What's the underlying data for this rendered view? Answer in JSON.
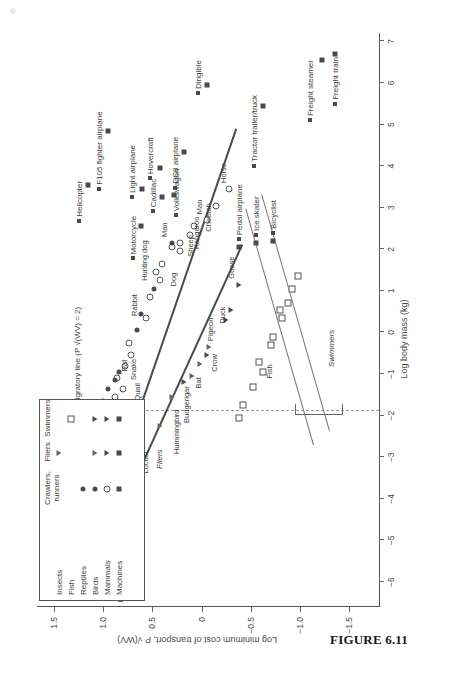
{
  "caption": "FIGURE 6.11",
  "chart_data": {
    "type": "scatter",
    "title": "",
    "xlabel": "Log body mass (kg)",
    "ylabel": "Log minimum cost of transport, P √(WV)",
    "xlim": [
      -6.6,
      7.2
    ],
    "ylim": [
      -1.8,
      1.65
    ],
    "xticks": [
      -6,
      -5,
      -4,
      -3,
      -2,
      -1,
      0,
      1,
      2,
      3,
      4,
      5,
      6,
      7
    ],
    "yticks": [
      1.5,
      1.0,
      0.5,
      0,
      -0.5,
      -1.0,
      -1.5
    ],
    "grid": false,
    "annotations": {
      "migratory_line": "Migratory line (P √(WV) = 2)",
      "group_runners": "Runners",
      "group_fliers": "Fliers",
      "group_swimmers": "Swimmers"
    },
    "legend": {
      "position": "top-left-inset",
      "columns": [
        "Crawlers,\nrunners",
        "Fliers",
        "Swimmers"
      ],
      "rows": [
        {
          "label": "Insects",
          "crawlers": "",
          "fliers": "tri-o",
          "swimmers": ""
        },
        {
          "label": "Fish",
          "crawlers": "",
          "fliers": "",
          "swimmers": "sq-o"
        },
        {
          "label": "Reptiles",
          "crawlers": "circ-f",
          "fliers": "",
          "swimmers": ""
        },
        {
          "label": "Birds",
          "crawlers": "circ-f",
          "fliers": "tri-o",
          "swimmers": "tri-f"
        },
        {
          "label": "Mammals",
          "crawlers": "circ-o",
          "fliers": "tri-f",
          "swimmers": "tri-f"
        },
        {
          "label": "Machines",
          "crawlers": "sq-f",
          "fliers": "sq-f",
          "swimmers": "sq-f"
        }
      ]
    },
    "series": [
      {
        "name": "Fliers (insects/birds/bats)",
        "marker": "tri-o",
        "points": [
          {
            "x": -6.15,
            "y": 0.95,
            "label": "Fly"
          },
          {
            "x": -6.35,
            "y": 1.22,
            "label": ""
          },
          {
            "x": -6.05,
            "y": 1.1,
            "label": ""
          },
          {
            "x": -5.75,
            "y": 1.25,
            "label": ""
          },
          {
            "x": -5.55,
            "y": 1.13,
            "label": "Mosquito"
          },
          {
            "x": -5.8,
            "y": 0.92,
            "label": ""
          },
          {
            "x": -5.55,
            "y": 0.93,
            "label": ""
          },
          {
            "x": -5.3,
            "y": 0.92,
            "label": ""
          },
          {
            "x": -5.45,
            "y": 0.82,
            "label": ""
          },
          {
            "x": -5.05,
            "y": 0.99,
            "label": "Blowfly"
          },
          {
            "x": -4.75,
            "y": 1.02,
            "label": ""
          },
          {
            "x": -4.5,
            "y": 1.05,
            "label": ""
          },
          {
            "x": -4.25,
            "y": 1.07,
            "label": "Bee"
          },
          {
            "x": -3.15,
            "y": 0.72,
            "label": "Locust"
          },
          {
            "x": -2.25,
            "y": 0.42,
            "label": "Hummingbird"
          },
          {
            "x": -1.55,
            "y": 0.3,
            "label": "Budgerigar"
          },
          {
            "x": -1.05,
            "y": 0.1,
            "label": ""
          },
          {
            "x": -0.75,
            "y": 0.02,
            "label": "Crow"
          },
          {
            "x": -0.35,
            "y": -0.08,
            "label": "Pigeon"
          }
        ]
      },
      {
        "name": "Fliers (mammal/bird filled)",
        "marker": "tri-f",
        "points": [
          {
            "x": -1.2,
            "y": 0.18,
            "label": "Bat"
          },
          {
            "x": -0.55,
            "y": -0.05,
            "label": ""
          },
          {
            "x": 0.3,
            "y": -0.25,
            "label": ""
          },
          {
            "x": 1.15,
            "y": -0.38,
            "label": "Goose"
          },
          {
            "x": 0.55,
            "y": -0.3,
            "label": "Duck"
          }
        ]
      },
      {
        "name": "Runners (mammals, open)",
        "marker": "circ-o",
        "points": [
          {
            "x": -2.6,
            "y": 1.22,
            "label": "Mice"
          },
          {
            "x": -2.4,
            "y": 1.2,
            "label": ""
          },
          {
            "x": -2.15,
            "y": 1.3,
            "label": ""
          },
          {
            "x": -2.0,
            "y": 1.38,
            "label": ""
          },
          {
            "x": -1.7,
            "y": 1.24,
            "label": ""
          },
          {
            "x": -2.1,
            "y": 1.02,
            "label": ""
          },
          {
            "x": -1.55,
            "y": 0.88,
            "label": ""
          },
          {
            "x": -1.35,
            "y": 0.8,
            "label": "Quail"
          },
          {
            "x": -1.1,
            "y": 0.86,
            "label": ""
          },
          {
            "x": -0.8,
            "y": 0.78,
            "label": ""
          },
          {
            "x": -0.55,
            "y": 0.72,
            "label": "Rat"
          },
          {
            "x": -0.25,
            "y": 0.74,
            "label": ""
          },
          {
            "x": 0.35,
            "y": 0.56,
            "label": "Rabbit"
          },
          {
            "x": 0.85,
            "y": 0.52,
            "label": ""
          },
          {
            "x": 1.25,
            "y": 0.42,
            "label": "Dog"
          },
          {
            "x": 1.45,
            "y": 0.46,
            "label": ""
          },
          {
            "x": 1.65,
            "y": 0.4,
            "label": ""
          },
          {
            "x": 1.95,
            "y": 0.22,
            "label": ""
          },
          {
            "x": 2.05,
            "y": 0.3,
            "label": ""
          },
          {
            "x": 2.35,
            "y": 0.12,
            "label": "Sheep"
          },
          {
            "x": 2.55,
            "y": 0.08,
            "label": ""
          },
          {
            "x": 2.7,
            "y": -0.05,
            "label": "Man"
          },
          {
            "x": 3.05,
            "y": -0.15,
            "label": "Cheetah"
          },
          {
            "x": 3.45,
            "y": -0.28,
            "label": "Horse"
          },
          {
            "x": 2.15,
            "y": 0.22,
            "label": "Kangaroo"
          }
        ]
      },
      {
        "name": "Reptiles / crawlers (filled circles)",
        "marker": "circ-f",
        "points": [
          {
            "x": -2.05,
            "y": 1.02,
            "label": "Lizards"
          },
          {
            "x": -1.95,
            "y": 0.95,
            "label": ""
          },
          {
            "x": -1.85,
            "y": 1.08,
            "label": ""
          },
          {
            "x": -1.75,
            "y": 0.92,
            "label": ""
          },
          {
            "x": -1.65,
            "y": 1.0,
            "label": ""
          },
          {
            "x": -1.35,
            "y": 0.95,
            "label": ""
          },
          {
            "x": -1.15,
            "y": 0.88,
            "label": ""
          },
          {
            "x": -0.95,
            "y": 0.84,
            "label": "Snake"
          },
          {
            "x": 0.05,
            "y": 0.66,
            "label": ""
          },
          {
            "x": 0.45,
            "y": 0.62,
            "label": ""
          },
          {
            "x": 1.05,
            "y": 0.48,
            "label": "Hunting dog"
          },
          {
            "x": 2.15,
            "y": 0.3,
            "label": "Man"
          }
        ]
      },
      {
        "name": "Swimmers (fish, open squares)",
        "marker": "sq-o",
        "points": [
          {
            "x": -1.3,
            "y": -0.52,
            "label": "Fish"
          },
          {
            "x": -0.95,
            "y": -0.62,
            "label": ""
          },
          {
            "x": -0.7,
            "y": -0.58,
            "label": ""
          },
          {
            "x": -0.3,
            "y": -0.7,
            "label": ""
          },
          {
            "x": -0.1,
            "y": -0.72,
            "label": ""
          },
          {
            "x": 0.35,
            "y": -0.82,
            "label": ""
          },
          {
            "x": 0.55,
            "y": -0.8,
            "label": ""
          },
          {
            "x": 0.7,
            "y": -0.88,
            "label": ""
          },
          {
            "x": 1.05,
            "y": -0.92,
            "label": ""
          },
          {
            "x": 1.35,
            "y": -0.98,
            "label": ""
          },
          {
            "x": -2.05,
            "y": -0.38,
            "label": ""
          },
          {
            "x": -1.75,
            "y": -0.42,
            "label": ""
          }
        ]
      },
      {
        "name": "Machines (filled squares)",
        "marker": "sq-f",
        "points": [
          {
            "x": 2.55,
            "y": 0.62,
            "label": "Motorcycle"
          },
          {
            "x": 3.45,
            "y": 0.6,
            "label": "Light airplane"
          },
          {
            "x": 3.25,
            "y": 0.4,
            "label": "Cadillac"
          },
          {
            "x": 3.3,
            "y": 0.28,
            "label": "Volkswagon"
          },
          {
            "x": 3.95,
            "y": 0.42,
            "label": "Hovercraft"
          },
          {
            "x": 4.85,
            "y": 0.95,
            "label": "F105 fighter airplane"
          },
          {
            "x": 4.35,
            "y": 0.18,
            "label": "DC8 airplane"
          },
          {
            "x": 5.95,
            "y": -0.05,
            "label": "Dirigible"
          },
          {
            "x": 5.45,
            "y": -0.62,
            "label": "Tractor trailer/truck"
          },
          {
            "x": 3.55,
            "y": 1.15,
            "label": "Helicopter"
          },
          {
            "x": 2.05,
            "y": -0.38,
            "label": "Pedal airplane"
          },
          {
            "x": 2.15,
            "y": -0.55,
            "label": "Ice skater"
          },
          {
            "x": 2.2,
            "y": -0.72,
            "label": "Bicyclist"
          },
          {
            "x": 6.55,
            "y": -1.22,
            "label": "Freight steamer"
          },
          {
            "x": 6.7,
            "y": -1.35,
            "label": "Freight train"
          }
        ]
      }
    ]
  }
}
